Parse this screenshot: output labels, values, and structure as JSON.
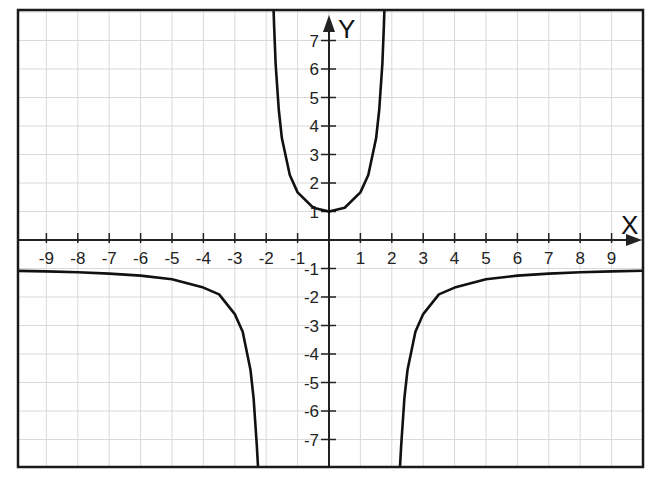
{
  "chart_data": {
    "type": "line",
    "title": "",
    "xlabel": "X",
    "ylabel": "Y",
    "xlim": [
      -10,
      10
    ],
    "ylim": [
      -7.9,
      8
    ],
    "grid": true,
    "legend": null,
    "x_ticks": [
      -9,
      -8,
      -7,
      -6,
      -5,
      -4,
      -3,
      -2,
      -1,
      1,
      2,
      3,
      4,
      5,
      6,
      7,
      8,
      9
    ],
    "y_ticks": [
      -7,
      -6,
      -5,
      -4,
      -3,
      -2,
      -1,
      1,
      2,
      3,
      4,
      5,
      6,
      7
    ],
    "x_tick_labels": [
      "-9",
      "-8",
      "-7",
      "-6",
      "-5",
      "-4",
      "-3",
      "-2",
      "-1",
      "1",
      "2",
      "3",
      "4",
      "5",
      "6",
      "7",
      "8",
      "9"
    ],
    "y_tick_labels": [
      "-7",
      "-6",
      "-5",
      "-4",
      "-3",
      "-2",
      "-1",
      "1",
      "2",
      "3",
      "4",
      "5",
      "6",
      "7"
    ],
    "vertical_asymptotes": [
      -2,
      2
    ],
    "horizontal_asymptote": -1,
    "series": [
      {
        "name": "left branch",
        "x": [
          -10,
          -9,
          -8,
          -7,
          -6,
          -5,
          -4,
          -3.5,
          -3,
          -2.75,
          -2.5,
          -2.4,
          -2.3,
          -2.25
        ],
        "y": [
          -1.08,
          -1.1,
          -1.13,
          -1.18,
          -1.25,
          -1.38,
          -1.67,
          -1.91,
          -2.6,
          -3.22,
          -4.56,
          -5.55,
          -7.2,
          -8.2
        ]
      },
      {
        "name": "middle branch",
        "x": [
          -1.78,
          -1.75,
          -1.7,
          -1.6,
          -1.5,
          -1.25,
          -1,
          -0.5,
          0,
          0.5,
          1,
          1.25,
          1.5,
          1.6,
          1.7,
          1.75,
          1.78
        ],
        "y": [
          8.6,
          7.53,
          6.2,
          4.56,
          3.57,
          2.28,
          1.67,
          1.13,
          1,
          1.13,
          1.67,
          2.28,
          3.57,
          4.56,
          6.2,
          7.53,
          8.6
        ]
      },
      {
        "name": "right branch",
        "x": [
          2.25,
          2.3,
          2.4,
          2.5,
          2.75,
          3,
          3.5,
          4,
          5,
          6,
          7,
          8,
          9,
          10
        ],
        "y": [
          -8.2,
          -7.2,
          -5.55,
          -4.56,
          -3.22,
          -2.6,
          -1.91,
          -1.67,
          -1.38,
          -1.25,
          -1.18,
          -1.13,
          -1.1,
          -1.08
        ]
      }
    ]
  },
  "colors": {
    "background": "#ffffff",
    "grid": "#d9d9d9",
    "axis": "#222222",
    "frame": "#1a1a1a",
    "curve": "#111111"
  },
  "layout_px": {
    "frame": {
      "left": 18,
      "top": 10,
      "right": 643,
      "bottom": 467
    },
    "origin": {
      "x": 329,
      "y": 240
    },
    "unit_x": 31.4,
    "unit_y": 28.5
  }
}
